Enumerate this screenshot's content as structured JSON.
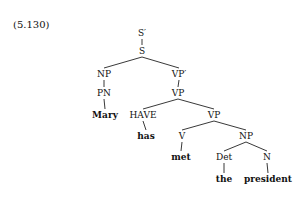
{
  "example_number": "(5.130)",
  "nodes": [
    {
      "id": "sbar",
      "label": "S′",
      "x": 142,
      "y": 33,
      "word": false
    },
    {
      "id": "s",
      "label": "S",
      "x": 142,
      "y": 51,
      "word": false
    },
    {
      "id": "np1",
      "label": "NP",
      "x": 104,
      "y": 74,
      "word": false
    },
    {
      "id": "vpbar",
      "label": "VP′",
      "x": 179,
      "y": 74,
      "word": false
    },
    {
      "id": "pn",
      "label": "PN",
      "x": 104,
      "y": 93,
      "word": false
    },
    {
      "id": "vp1",
      "label": "VP",
      "x": 178,
      "y": 93,
      "word": false
    },
    {
      "id": "mary",
      "label": "Mary",
      "x": 105,
      "y": 115,
      "word": true
    },
    {
      "id": "have",
      "label": "HAVE",
      "x": 143,
      "y": 115,
      "word": false
    },
    {
      "id": "vp2",
      "label": "VP",
      "x": 214,
      "y": 115,
      "word": false
    },
    {
      "id": "has",
      "label": "has",
      "x": 146,
      "y": 136,
      "word": true
    },
    {
      "id": "v",
      "label": "V",
      "x": 182,
      "y": 136,
      "word": false
    },
    {
      "id": "np2",
      "label": "NP",
      "x": 246,
      "y": 136,
      "word": false
    },
    {
      "id": "met",
      "label": "met",
      "x": 181,
      "y": 157,
      "word": true
    },
    {
      "id": "det",
      "label": "Det",
      "x": 224,
      "y": 157,
      "word": false
    },
    {
      "id": "n",
      "label": "N",
      "x": 267,
      "y": 157,
      "word": false
    },
    {
      "id": "the",
      "label": "the",
      "x": 224,
      "y": 179,
      "word": true
    },
    {
      "id": "president",
      "label": "president",
      "x": 268,
      "y": 179,
      "word": true
    }
  ],
  "edges": [
    [
      "sbar",
      "s"
    ],
    [
      "s",
      "np1"
    ],
    [
      "s",
      "vpbar"
    ],
    [
      "np1",
      "pn"
    ],
    [
      "vpbar",
      "vp1"
    ],
    [
      "pn",
      "mary"
    ],
    [
      "vp1",
      "have"
    ],
    [
      "vp1",
      "vp2"
    ],
    [
      "have",
      "has"
    ],
    [
      "vp2",
      "v"
    ],
    [
      "vp2",
      "np2"
    ],
    [
      "v",
      "met"
    ],
    [
      "np2",
      "det"
    ],
    [
      "np2",
      "n"
    ],
    [
      "det",
      "the"
    ],
    [
      "n",
      "president"
    ]
  ]
}
